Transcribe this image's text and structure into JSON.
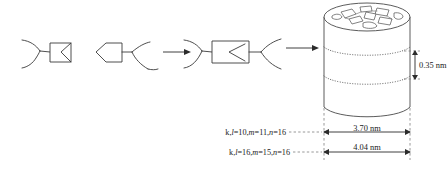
{
  "figure": {
    "background_color": "#ffffff",
    "line_color": "#3a3a3a",
    "dimension_color": "#2b2b2b",
    "leader_color": "#7d7d7d"
  },
  "reaction_steps": [
    {
      "id": "step-1",
      "name": "monomer-unit"
    },
    {
      "id": "step-2",
      "name": "pentagon-fork-unit"
    },
    {
      "id": "step-3",
      "name": "assembled-dendron"
    },
    {
      "id": "step-4",
      "name": "columnar-stack"
    }
  ],
  "arrows": [
    {
      "id": "arrow-1",
      "name": "reaction-arrow-first"
    },
    {
      "id": "arrow-2",
      "name": "reaction-arrow-second"
    }
  ],
  "dimensions": {
    "stack_period": "0.35 nm",
    "inner_diameter": "3.70 nm",
    "outer_diameter": "4.04 nm"
  },
  "index_labels": [
    {
      "id": "index-inner",
      "prefix": "k,",
      "l_symbol": "l",
      "l_value": "=10,",
      "m_symbol": "m",
      "m_value": "=11,",
      "n_symbol": "n",
      "n_value": "=16",
      "full": "k,l=10,m=11,n=16"
    },
    {
      "id": "index-outer",
      "prefix": "k,",
      "l_symbol": "l",
      "l_value": "=16,",
      "m_symbol": "m",
      "m_value": "=15,",
      "n_symbol": "n",
      "n_value": "=16",
      "full": "k,l=16,m=15,n=16"
    }
  ],
  "cylinder": {
    "name": "columnar-nanostructure",
    "layer_count": 2,
    "top_fragment_count": 9
  }
}
